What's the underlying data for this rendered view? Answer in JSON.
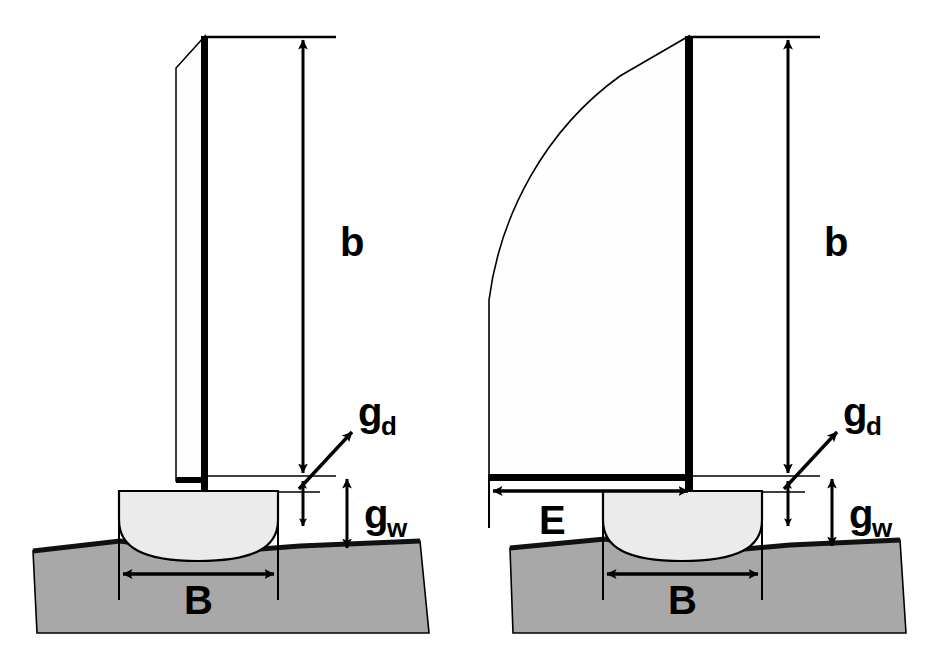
{
  "figure": {
    "background_color": "#ffffff",
    "colors": {
      "line": "#000000",
      "water_fill": "#a8a8a8",
      "water_edge": "#1a1a1a",
      "hull_fill": "#ebebeb",
      "sail_fill": "#ffffff",
      "mast": "#000000"
    }
  },
  "panels": [
    {
      "id": "left",
      "name": "narrow-sail-panel",
      "has_boom_dimension": false,
      "sail_type": "tall-narrow-sail",
      "labels": {
        "mast_height": {
          "symbol": "b",
          "sub": ""
        },
        "diagonal_gap": {
          "symbol": "g",
          "sub": "d"
        },
        "water_gap": {
          "symbol": "g",
          "sub": "w"
        },
        "beam": {
          "symbol": "B",
          "sub": ""
        }
      }
    },
    {
      "id": "right",
      "name": "wide-sail-panel",
      "has_boom_dimension": true,
      "sail_type": "large-curved-sail",
      "labels": {
        "mast_height": {
          "symbol": "b",
          "sub": ""
        },
        "diagonal_gap": {
          "symbol": "g",
          "sub": "d"
        },
        "water_gap": {
          "symbol": "g",
          "sub": "w"
        },
        "beam": {
          "symbol": "B",
          "sub": ""
        },
        "boom_length": {
          "symbol": "E",
          "sub": ""
        }
      }
    }
  ],
  "legend_symbols": [
    {
      "symbol": "b",
      "sub": "",
      "meaning": "mast height above waterline"
    },
    {
      "symbol": "g",
      "sub": "d",
      "meaning": "diagonal gap"
    },
    {
      "symbol": "g",
      "sub": "w",
      "meaning": "vertical gap to water surface"
    },
    {
      "symbol": "B",
      "sub": "",
      "meaning": "hull beam"
    },
    {
      "symbol": "E",
      "sub": "",
      "meaning": "boom length"
    }
  ]
}
